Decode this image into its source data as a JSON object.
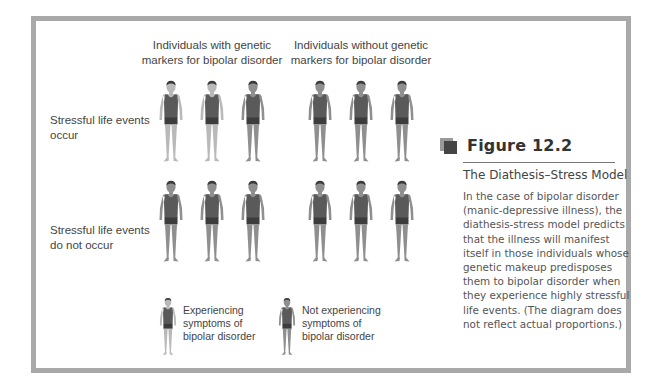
{
  "diagram": {
    "column_headers": [
      {
        "line1": "Individuals with genetic",
        "line2": "markers for bipolar disorder"
      },
      {
        "line1": "Individuals without genetic",
        "line2": "markers for bipolar disorder"
      }
    ],
    "row_labels": [
      {
        "line1": "Stressful life events",
        "line2": "occur"
      },
      {
        "line1": "Stressful life events",
        "line2": "do not occur"
      }
    ],
    "grid": [
      {
        "row": "Stressful life events occur",
        "with_markers": [
          "experiencing",
          "experiencing",
          "not-experiencing"
        ],
        "without_markers": [
          "not-experiencing",
          "not-experiencing",
          "not-experiencing"
        ]
      },
      {
        "row": "Stressful life events do not occur",
        "with_markers": [
          "not-experiencing",
          "not-experiencing",
          "not-experiencing"
        ],
        "without_markers": [
          "not-experiencing",
          "not-experiencing",
          "not-experiencing"
        ]
      }
    ],
    "legend": [
      {
        "key": "experiencing",
        "line1": "Experiencing",
        "line2": "symptoms of",
        "line3": "bipolar disorder"
      },
      {
        "key": "not-experiencing",
        "line1": "Not experiencing",
        "line2": "symptoms of",
        "line3": "bipolar disorder"
      }
    ],
    "colors": {
      "frame": "#a9a9a9",
      "experiencing_skin": "#b9b9b9",
      "not_experiencing_skin": "#8f8f8f",
      "shirt": "#5a5a5a",
      "shorts": "#3c3c3c",
      "hair": "#3a3a3a"
    }
  },
  "caption": {
    "figure_label": "Figure 12.2",
    "title": "The Diathesis–Stress Model",
    "lines": [
      "In the case of bipolar disorder",
      "(manic-depressive illness), the",
      "diathesis-stress model predicts",
      "that the illness will manifest",
      "itself in those individuals whose",
      "genetic makeup predisposes",
      "them to bipolar disorder when",
      "they experience highly stressful",
      "life events. (The diagram does",
      "not reflect actual proportions.)"
    ]
  }
}
